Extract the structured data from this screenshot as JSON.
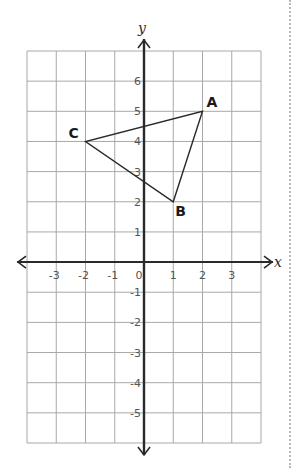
{
  "diagram": {
    "type": "coordinate-plane-triangle",
    "axes": {
      "x_label": "x",
      "y_label": "y",
      "x_range": [
        -4,
        4
      ],
      "y_range": [
        -6,
        7
      ],
      "x_ticks": [
        {
          "value": -3,
          "label": "-3"
        },
        {
          "value": -2,
          "label": "-2"
        },
        {
          "value": -1,
          "label": "-1"
        },
        {
          "value": 0,
          "label": "0"
        },
        {
          "value": 1,
          "label": "1"
        },
        {
          "value": 2,
          "label": "2"
        },
        {
          "value": 3,
          "label": "3"
        }
      ],
      "y_ticks": [
        {
          "value": 6,
          "label": "6"
        },
        {
          "value": 5,
          "label": "5"
        },
        {
          "value": 4,
          "label": "4"
        },
        {
          "value": 3,
          "label": "3"
        },
        {
          "value": 2,
          "label": "2"
        },
        {
          "value": 1,
          "label": "1"
        },
        {
          "value": -1,
          "label": "-1"
        },
        {
          "value": -2,
          "label": "-2"
        },
        {
          "value": -3,
          "label": "-3"
        },
        {
          "value": -4,
          "label": "-4"
        },
        {
          "value": -5,
          "label": "-5"
        }
      ]
    },
    "points": [
      {
        "label": "A",
        "x": 2,
        "y": 5
      },
      {
        "label": "B",
        "x": 1,
        "y": 2
      },
      {
        "label": "C",
        "x": -2,
        "y": 4
      }
    ],
    "colors": {
      "grid": "#a8a8a8",
      "axis": "#2a2a2a",
      "triangle": "#2a2a2a",
      "tick_label": "#555555",
      "point_label": "#1a1a1a"
    }
  }
}
